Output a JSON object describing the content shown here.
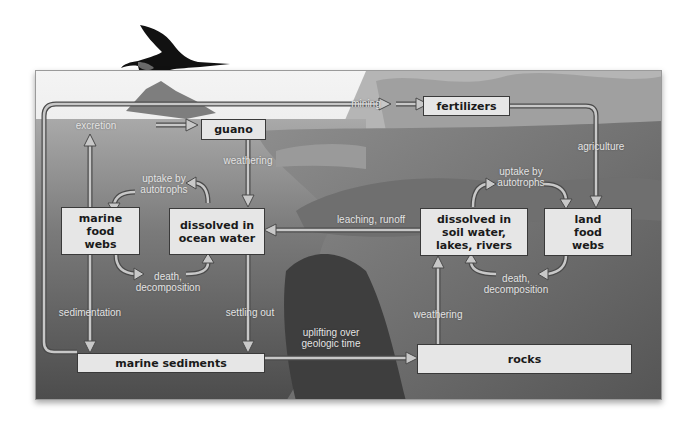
{
  "diagram": {
    "colors": {
      "box_fill": "#e6e6e6",
      "box_border": "#3a3a3a",
      "arrow_fill": "#c8c8c8",
      "arrow_outline": "#4a4a4a",
      "label_text": "#e4e4e4"
    },
    "boxes": {
      "guano": "guano",
      "fertilizers": "fertilizers",
      "marine_food_webs": "marine\nfood\nwebs",
      "dissolved_ocean": "dissolved in\nocean water",
      "dissolved_soil": "dissolved in\nsoil water,\nlakes, rivers",
      "land_food_webs": "land\nfood\nwebs",
      "marine_sediments": "marine sediments",
      "rocks": "rocks"
    },
    "labels": {
      "mining": "mining",
      "excretion": "excretion",
      "weathering_top": "weathering",
      "agriculture": "agriculture",
      "uptake_marine": "uptake by\nautotrophs",
      "uptake_land": "uptake by\nautotrophs",
      "leaching": "leaching, runoff",
      "death_marine": "death,\ndecomposition",
      "death_land": "death,\ndecomposition",
      "sedimentation": "sedimentation",
      "settling": "settling out",
      "uplifting": "uplifting over\ngeologic time",
      "weathering_bottom": "weathering"
    },
    "icons": {
      "bird": "frigatebird-silhouette"
    }
  }
}
